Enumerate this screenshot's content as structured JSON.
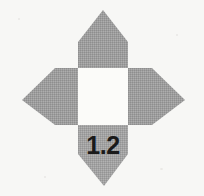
{
  "figure": {
    "name": "four-armed compass rosette",
    "label": "1.2",
    "label_position": "bottom-arm",
    "background_color": "#f7f7f5",
    "arm_fill_color": "#9b9b9b",
    "arm_texture": "dithered halftone",
    "center_fill_color": "#fbfbf9",
    "label_color": "#1a1a1a",
    "arms": [
      {
        "name": "north-arm",
        "direction": "up",
        "tip": "103,10"
      },
      {
        "name": "east-arm",
        "direction": "right",
        "tip": "185,100"
      },
      {
        "name": "south-arm",
        "direction": "down",
        "tip": "104,186"
      },
      {
        "name": "west-arm",
        "direction": "left",
        "tip": "22,100"
      }
    ],
    "center": {
      "name": "center-square",
      "x": 78,
      "y": 68,
      "width": 50,
      "height": 57
    },
    "canvas": {
      "width": 204,
      "height": 196
    }
  }
}
